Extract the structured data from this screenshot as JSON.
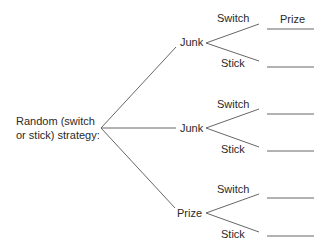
{
  "root": {
    "line1": "Random (switch",
    "line2": "or stick) strategy:"
  },
  "branches": [
    {
      "label": "Junk",
      "options": [
        {
          "label": "Switch",
          "outcome": "Prize"
        },
        {
          "label": "Stick",
          "outcome": ""
        }
      ]
    },
    {
      "label": "Junk",
      "options": [
        {
          "label": "Switch",
          "outcome": ""
        },
        {
          "label": "Stick",
          "outcome": ""
        }
      ]
    },
    {
      "label": "Prize",
      "options": [
        {
          "label": "Switch",
          "outcome": ""
        },
        {
          "label": "Stick",
          "outcome": ""
        }
      ]
    }
  ],
  "colors": {
    "line": "#555555",
    "text": "#2a2a2a"
  }
}
